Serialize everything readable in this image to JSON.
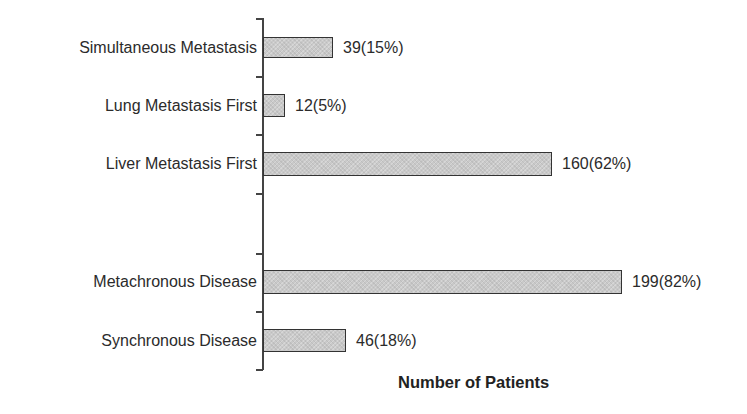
{
  "chart_data": {
    "type": "bar",
    "orientation": "horizontal",
    "title": "",
    "xlabel": "Number of Patients",
    "ylabel": "",
    "categories": [
      "Simultaneous Metastasis",
      "Lung Metastasis First",
      "Liver Metastasis First",
      "Metachronous Disease",
      "Synchronous Disease"
    ],
    "values": [
      39,
      12,
      160,
      199,
      46
    ],
    "percentages": [
      15,
      5,
      62,
      82,
      18
    ],
    "data_labels": [
      "39(15%)",
      "12(5%)",
      "160(62%)",
      "199(82%)",
      "46(18%)"
    ],
    "xlim": [
      0,
      266
    ],
    "grid": false,
    "legend": null,
    "bar_color": "#c9c9c9",
    "bar_edge_color": "#333333"
  },
  "layout": {
    "bars": [
      {
        "top": 37,
        "height": 21
      },
      {
        "top": 94,
        "height": 23
      },
      {
        "top": 152,
        "height": 24
      },
      {
        "top": 270,
        "height": 24
      },
      {
        "top": 329,
        "height": 23
      }
    ],
    "ticks_y": [
      18,
      76,
      134,
      193,
      253,
      311,
      369
    ],
    "px_per_unit": 1.804,
    "axis_x": 263
  }
}
